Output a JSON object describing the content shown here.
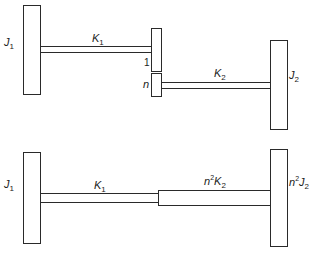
{
  "diagram": {
    "type": "geared-shaft-system",
    "top": {
      "title": "Original geared system",
      "inertia_1": {
        "symbol": "J",
        "sub": "1"
      },
      "shaft_1": {
        "symbol": "K",
        "sub": "1"
      },
      "gear_1_ratio": "1",
      "gear_n_ratio": "n",
      "shaft_2": {
        "symbol": "K",
        "sub": "2"
      },
      "inertia_2": {
        "symbol": "J",
        "sub": "2"
      }
    },
    "bottom": {
      "title": "Equivalent system referred to shaft 1",
      "inertia_1": {
        "symbol": "J",
        "sub": "1"
      },
      "shaft_1": {
        "symbol": "K",
        "sub": "1"
      },
      "shaft_2_equiv": {
        "prefix": "n",
        "exp": "2",
        "symbol": "K",
        "sub": "2"
      },
      "inertia_2_equiv": {
        "prefix": "n",
        "exp": "2",
        "symbol": "J",
        "sub": "2"
      }
    },
    "colors": {
      "stroke": "#2a2a2a",
      "fill": "#ffffff",
      "text": "#222222"
    }
  }
}
